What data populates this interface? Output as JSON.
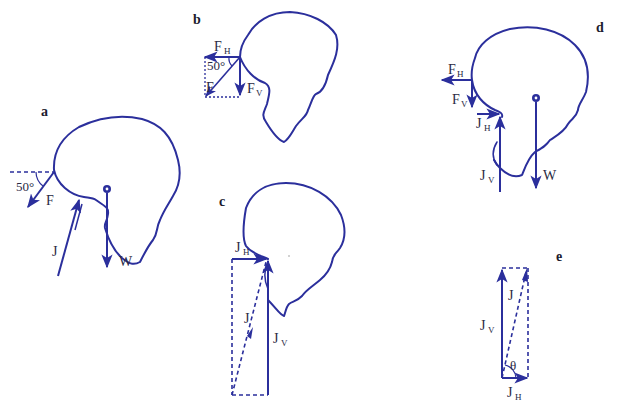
{
  "figure": {
    "colors": {
      "stroke": "#2b2f9c",
      "text": "#2a2a44"
    },
    "panels": {
      "a": {
        "label": "a",
        "angle": "50°",
        "vectors": {
          "F": "F",
          "J": "J",
          "W": "W"
        }
      },
      "b": {
        "label": "b",
        "angle": "50°",
        "vectors": {
          "F": "F",
          "FH": "F",
          "FH_sub": "H",
          "FV": "F",
          "FV_sub": "V"
        }
      },
      "c": {
        "label": "c",
        "vectors": {
          "J": "J",
          "JH": "J",
          "JH_sub": "H",
          "JV": "J",
          "JV_sub": "V"
        }
      },
      "d": {
        "label": "d",
        "vectors": {
          "FH": "F",
          "FH_sub": "H",
          "FV": "F",
          "FV_sub": "V",
          "JH": "J",
          "JH_sub": "H",
          "JV": "J",
          "JV_sub": "V",
          "W": "W"
        }
      },
      "e": {
        "label": "e",
        "angle": "θ",
        "vectors": {
          "J": "J",
          "JV": "J",
          "JV_sub": "V",
          "JH": "J",
          "JH_sub": "H"
        }
      }
    }
  }
}
